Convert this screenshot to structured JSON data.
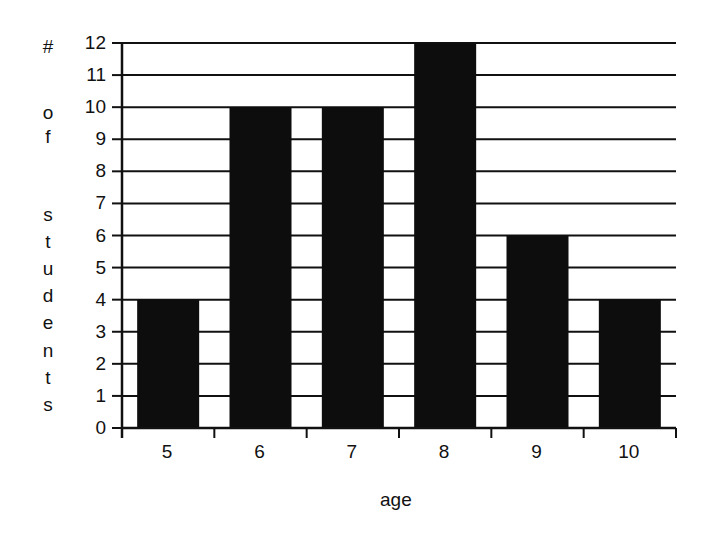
{
  "chart_data": {
    "type": "bar",
    "title": "",
    "xlabel": "age",
    "ylabel": "# of students",
    "ylabel_letters": [
      "#",
      "",
      "o",
      "f",
      "",
      "s",
      "t",
      "u",
      "d",
      "e",
      "n",
      "t",
      "s"
    ],
    "categories": [
      "5",
      "6",
      "7",
      "8",
      "9",
      "10"
    ],
    "values": [
      4,
      10,
      10,
      12,
      6,
      4
    ],
    "ylim": [
      0,
      12
    ],
    "yticks": [
      0,
      1,
      2,
      3,
      4,
      5,
      6,
      7,
      8,
      9,
      10,
      11,
      12
    ],
    "grid": true,
    "legend": null,
    "colors": {
      "bar": "#0d0d0d",
      "grid": "#111111",
      "axis": "#111111",
      "background": "#ffffff"
    }
  }
}
